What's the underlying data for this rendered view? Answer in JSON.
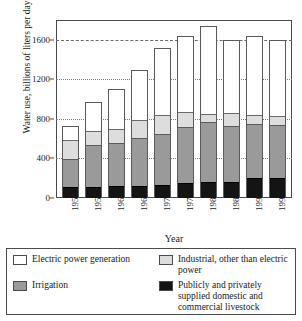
{
  "chart_data": {
    "type": "bar",
    "subtype": "stacked-bar",
    "title": "",
    "xlabel": "Year",
    "ylabel": "Water use, billions of liters per day",
    "categories": [
      "1950",
      "1955",
      "1960",
      "1965",
      "1970",
      "1975",
      "1980",
      "1985",
      "1990",
      "1995"
    ],
    "ylim": [
      0,
      1800
    ],
    "yticks": [
      0,
      400,
      800,
      1200,
      1600
    ],
    "ytick_labels": [
      "0",
      "400",
      "800",
      "1200",
      "1600"
    ],
    "grid": true,
    "grid_axis": "y",
    "legend_position": "below",
    "series": [
      {
        "name": "Publicly and privately supplied domestic and commercial livestock",
        "color": "#141414",
        "values": [
          110,
          110,
          120,
          125,
          135,
          150,
          160,
          165,
          205,
          205
        ]
      },
      {
        "name": "Irrigation",
        "color": "#9a9a9a",
        "values": [
          285,
          430,
          440,
          485,
          520,
          570,
          610,
          570,
          545,
          540
        ]
      },
      {
        "name": "Industrial, other than electric power",
        "color": "#dddddd",
        "values": [
          195,
          140,
          145,
          190,
          195,
          160,
          80,
          135,
          95,
          90
        ]
      },
      {
        "name": "Electric power generation",
        "color": "#ffffff",
        "values": [
          140,
          290,
          395,
          490,
          670,
          760,
          890,
          730,
          795,
          765
        ]
      }
    ],
    "stack_tops": {
      "domestic": [
        110,
        110,
        120,
        125,
        135,
        150,
        160,
        165,
        205,
        205
      ],
      "irrigation": [
        395,
        540,
        560,
        610,
        655,
        720,
        770,
        735,
        750,
        745
      ],
      "industrial": [
        590,
        680,
        705,
        800,
        850,
        880,
        850,
        870,
        845,
        835
      ],
      "total": [
        730,
        970,
        1100,
        1290,
        1520,
        1640,
        1740,
        1600,
        1640,
        1600
      ]
    }
  },
  "legend": {
    "items": [
      {
        "label": "Electric power generation",
        "swatch": "electric"
      },
      {
        "label": "Industrial, other than electric power",
        "swatch": "industrial"
      },
      {
        "label": "Irrigation",
        "swatch": "irrigation"
      },
      {
        "label": "Publicly and privately supplied domestic and commercial livestock",
        "swatch": "domestic"
      }
    ]
  }
}
